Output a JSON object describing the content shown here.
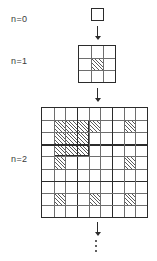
{
  "figure": {
    "type": "iterative-fractal-construction",
    "background_color": "#ffffff",
    "line_color": "#2b2b2b",
    "thin_line_color": "#6e6e6e",
    "hatch_color": "#5a5a5a"
  },
  "stages": [
    {
      "label": "n=0",
      "grid_divisions": 1,
      "hatched_cells": [],
      "note": "single empty unit square"
    },
    {
      "label": "n=1",
      "grid_divisions": 3,
      "hatched_cells": [
        [
          1,
          1
        ]
      ],
      "note": "3 by 3 grid with the centre cell hatched"
    },
    {
      "label": "n=2",
      "grid_divisions": 9,
      "thick_line_interval": 3,
      "hatched_block": {
        "row": 1,
        "col": 1,
        "size": 3
      },
      "hatched_cells": [
        [
          1,
          1
        ],
        [
          1,
          4
        ],
        [
          1,
          7
        ],
        [
          4,
          1
        ],
        [
          4,
          7
        ],
        [
          7,
          1
        ],
        [
          7,
          4
        ],
        [
          7,
          7
        ]
      ],
      "note": "9 by 9 grid; centre 3x3 block fully hatched plus centre cell of each surrounding block"
    }
  ],
  "arrows": [
    {
      "name": "arrow-0to1",
      "direction": "down"
    },
    {
      "name": "arrow-1to2",
      "direction": "down"
    },
    {
      "name": "arrow-2toN",
      "direction": "down"
    }
  ],
  "continuation": {
    "symbol": "vertical-ellipsis",
    "dots": 3
  }
}
